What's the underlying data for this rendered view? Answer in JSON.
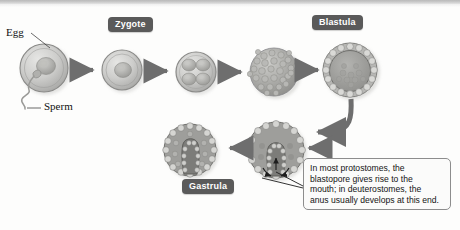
{
  "figure": {
    "topic": "animal embryonic development",
    "stage_labels": [
      {
        "name": "zygote",
        "text": "Zygote",
        "x": 108,
        "y": 17
      },
      {
        "name": "blastula",
        "text": "Blastula",
        "x": 312,
        "y": 15
      },
      {
        "name": "gastrula",
        "text": "Gastrula",
        "x": 182,
        "y": 179
      }
    ],
    "leader_labels": [
      {
        "name": "egg",
        "text": "Egg",
        "x": 6,
        "y": 28
      },
      {
        "name": "sperm",
        "text": "Sperm",
        "x": 44,
        "y": 100
      }
    ],
    "callout": {
      "line1": "In most protostomes, the",
      "line2": "blastopore gives rise to the",
      "line3": "mouth; in deuterostomes, the",
      "line4": "anus usually develops at this end."
    },
    "stages": [
      {
        "name": "fertilized-egg-with-sperm",
        "cx": 44,
        "cy": 68,
        "r": 26
      },
      {
        "name": "zygote-single-cell",
        "cx": 122,
        "cy": 70,
        "r": 21
      },
      {
        "name": "four-cell-stage",
        "cx": 196,
        "cy": 72,
        "r": 21
      },
      {
        "name": "morula-many-cell-stage",
        "cx": 274,
        "cy": 72,
        "r": 25
      },
      {
        "name": "blastula-hollow-sphere",
        "cx": 350,
        "cy": 70,
        "r": 28
      },
      {
        "name": "early-gastrula",
        "cx": 276,
        "cy": 150,
        "r": 29
      },
      {
        "name": "late-gastrula",
        "cx": 190,
        "cy": 150,
        "r": 27
      }
    ],
    "arrows": [
      {
        "name": "arrow-egg-to-zygote",
        "direction": "right"
      },
      {
        "name": "arrow-zygote-to-four-cell",
        "direction": "right"
      },
      {
        "name": "arrow-four-cell-to-morula",
        "direction": "right"
      },
      {
        "name": "arrow-morula-to-blastula",
        "direction": "right"
      },
      {
        "name": "arrow-blastula-to-gastrula",
        "direction": "curved-down-left"
      },
      {
        "name": "arrow-gastrula-to-late-gastrula",
        "direction": "left"
      }
    ],
    "colors": {
      "pill_background": "#5a5a5a",
      "pill_text": "#ffffff",
      "cell_fill": "#c9c9c7",
      "cell_stroke": "#8a8a88",
      "arrow": "#6e6e6e",
      "callout_border": "#8d8d8d",
      "page_background": "#fdfdfc"
    }
  }
}
